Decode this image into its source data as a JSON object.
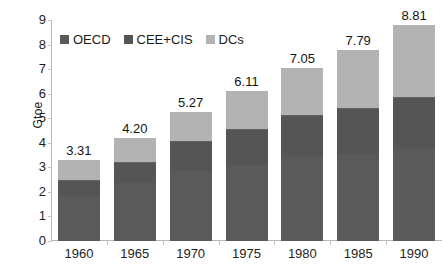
{
  "chart_data": {
    "type": "bar",
    "subtype": "stacked-bar",
    "title": "",
    "xlabel": "",
    "ylabel": "Gtoe",
    "ylim": [
      0,
      9
    ],
    "yticks": [
      0,
      1,
      2,
      3,
      4,
      5,
      6,
      7,
      8,
      9
    ],
    "ytick_labels": [
      "0",
      "1",
      "2",
      "3",
      "4",
      "5",
      "6",
      "7",
      "8",
      "9"
    ],
    "grid": false,
    "legend_position": "top-left-inside",
    "categories": [
      "1960",
      "1965",
      "1970",
      "1975",
      "1980",
      "1985",
      "1990"
    ],
    "series": [
      {
        "name": "OECD",
        "color": "#5a5a5a",
        "values": [
          1.85,
          2.35,
          2.85,
          3.1,
          3.45,
          3.55,
          3.8
        ]
      },
      {
        "name": "CEE+CIS",
        "color": "#555555",
        "values": [
          0.62,
          0.85,
          1.22,
          1.45,
          1.7,
          1.85,
          2.05
        ]
      },
      {
        "name": "DCs",
        "color": "#b3b3b3",
        "values": [
          0.84,
          1.0,
          1.2,
          1.56,
          1.9,
          2.39,
          2.96
        ]
      }
    ],
    "totals": [
      3.31,
      4.2,
      5.27,
      6.11,
      7.05,
      7.79,
      8.81
    ],
    "total_labels": [
      "3.31",
      "4.20",
      "5.27",
      "6.11",
      "7.05",
      "7.79",
      "8.81"
    ]
  },
  "legend": {
    "items": [
      {
        "label": "OECD",
        "swatch": "legend-swatch-oecd"
      },
      {
        "label": "CEE+CIS",
        "swatch": "legend-swatch-cee-cis"
      },
      {
        "label": "DCs",
        "swatch": "legend-swatch-dcs"
      }
    ]
  },
  "axes": {
    "y_title": "Gtoe"
  }
}
